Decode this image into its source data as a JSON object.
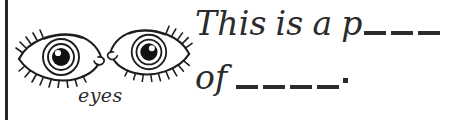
{
  "worksheet": {
    "caption": "eyes",
    "illustration": {
      "left_eye_name": "eye-illustration-left",
      "right_eye_name": "eye-illustration-right"
    },
    "sentence": {
      "line1": {
        "words": [
          "This",
          "is",
          "a",
          "p"
        ],
        "blank_count": 3
      },
      "line2": {
        "words": [
          "of"
        ],
        "blank_count": 4,
        "terminator": "."
      }
    },
    "colors": {
      "ink": "#2b2b2b",
      "rule": "#262626",
      "paper": "#ffffff"
    }
  }
}
